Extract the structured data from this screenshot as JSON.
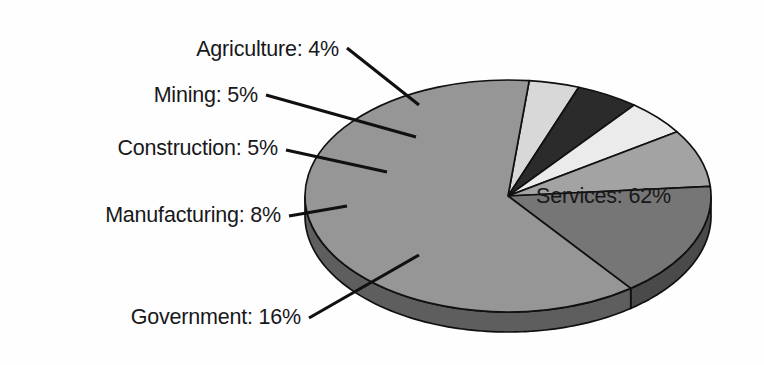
{
  "chart_data": {
    "type": "pie",
    "title": "",
    "subtitle": "",
    "xlabel": "",
    "ylabel": "",
    "legend_position": "none",
    "grid": false,
    "style": "3d-exploded-none",
    "units": "percent",
    "categories": [
      "Agriculture",
      "Mining",
      "Construction",
      "Manufacturing",
      "Government",
      "Services"
    ],
    "values": [
      4,
      5,
      5,
      8,
      16,
      62
    ],
    "labels": [
      "Agriculture: 4%",
      "Mining: 5%",
      "Construction: 5%",
      "Manufacturing: 8%",
      "Government: 16%",
      "Services: 62%"
    ],
    "slices": [
      {
        "name": "Agriculture",
        "label": "Agriculture: 4%",
        "value": 4,
        "color": "#d8d8d8",
        "side_color": "#9a9a9a",
        "label_position": "outside-upper-left",
        "label_anchor": "end",
        "label_x": 339,
        "label_y": 56,
        "leader": [
          [
            347,
            48
          ],
          [
            419,
            105
          ]
        ]
      },
      {
        "name": "Mining",
        "label": "Mining: 5%",
        "value": 5,
        "color": "#2b2b2b",
        "side_color": "#1b1b1b",
        "label_position": "outside-left",
        "label_anchor": "end",
        "label_x": 258,
        "label_y": 102,
        "leader": [
          [
            266,
            95
          ],
          [
            416,
            137
          ]
        ]
      },
      {
        "name": "Construction",
        "label": "Construction: 5%",
        "value": 5,
        "color": "#ebebeb",
        "side_color": "#a8a8a8",
        "label_position": "outside-left",
        "label_anchor": "end",
        "label_x": 278,
        "label_y": 155,
        "leader": [
          [
            286,
            150
          ],
          [
            387,
            172
          ]
        ]
      },
      {
        "name": "Manufacturing",
        "label": "Manufacturing: 8%",
        "value": 8,
        "color": "#a3a3a3",
        "side_color": "#6e6e6e",
        "label_position": "outside-left",
        "label_anchor": "end",
        "label_x": 281,
        "label_y": 222,
        "leader": [
          [
            289,
            216
          ],
          [
            347,
            206
          ]
        ]
      },
      {
        "name": "Government",
        "label": "Government: 16%",
        "value": 16,
        "color": "#767676",
        "side_color": "#4a4a4a",
        "label_position": "outside-lower-left",
        "label_anchor": "end",
        "label_x": 301,
        "label_y": 324,
        "leader": [
          [
            309,
            318
          ],
          [
            419,
            255
          ]
        ]
      },
      {
        "name": "Services",
        "label": "Services: 62%",
        "value": 62,
        "color": "#969696",
        "side_color": "#5e5e5e",
        "label_position": "inside",
        "label_anchor": "start",
        "label_x": 536,
        "label_y": 203,
        "leader": null
      }
    ],
    "geometry": {
      "center_x": 508,
      "center_y": 196,
      "radius_x": 203,
      "radius_y": 116,
      "depth": 20,
      "start_angle_deg": -84
    },
    "background_color": "#fefefe",
    "outline_color": "#101010"
  }
}
